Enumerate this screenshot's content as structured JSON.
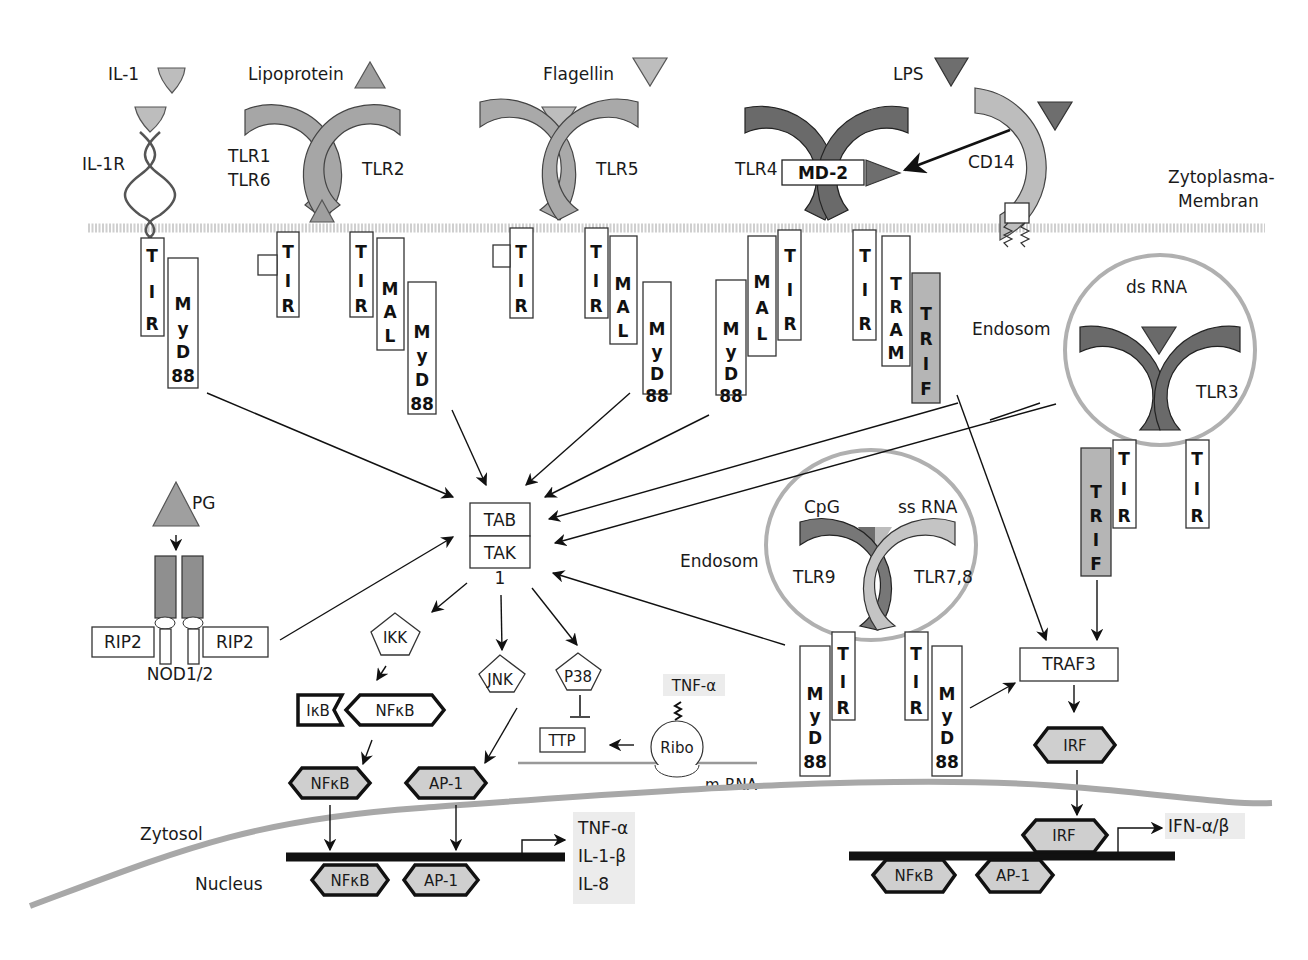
{
  "diagram": {
    "colors": {
      "ligand_light": "#bdbdbd",
      "ligand_dark": "#6e6e6e",
      "receptor_light": "#bfbfbf",
      "receptor_medium": "#9a9a9a",
      "receptor_dark": "#6a6a6a",
      "trif": "#b5b5b5",
      "transcription_factor": "#cfcfcf",
      "membrane": "#cfcfcf",
      "nuclear_membrane": "#a8a8a8"
    },
    "ligands": {
      "il1": "IL-1",
      "lipoprotein": "Lipoprotein",
      "flagellin": "Flagellin",
      "lps": "LPS",
      "ds_rna": "ds RNA",
      "cpg": "CpG",
      "ss_rna": "ss RNA",
      "pg": "PG"
    },
    "receptors": {
      "il1r": "IL-1R",
      "tlr1": "TLR1",
      "tlr6": "TLR6",
      "tlr2": "TLR2",
      "tlr5": "TLR5",
      "tlr4": "TLR4",
      "md2": "MD-2",
      "cd14": "CD14",
      "tlr3": "TLR3",
      "tlr9": "TLR9",
      "tlr78": "TLR7,8",
      "nod": "NOD1/2",
      "rip2_left": "RIP2",
      "rip2_right": "RIP2"
    },
    "adaptors": {
      "tir": [
        "T",
        "I",
        "R"
      ],
      "mal": [
        "M",
        "A",
        "L"
      ],
      "myd88": [
        "M",
        "y",
        "D",
        "88"
      ],
      "tram": [
        "T",
        "R",
        "A",
        "M"
      ],
      "trif": [
        "T",
        "R",
        "I",
        "F"
      ]
    },
    "compartments": {
      "plasma_membrane_line1": "Zytoplasma-",
      "plasma_membrane_line2": "Membran",
      "endosome_top": "Endosom",
      "endosome_mid": "Endosom",
      "cytosol": "Zytosol",
      "nucleus": "Nucleus"
    },
    "signaling": {
      "tab": "TAB",
      "tak": "TAK",
      "tak_sub": "1",
      "ikk": "IKK",
      "jnk": "JNK",
      "p38": "P38",
      "ikb": "IκB",
      "nfkb": "NFκB",
      "ap1": "AP-1",
      "ttp": "TTP",
      "ribo": "Ribo",
      "mrna": "m-RNA",
      "tnf_alpha_transcript": "TNF-α",
      "traf3": "TRAF3",
      "irf": "IRF"
    },
    "nucleus_factors": {
      "left": [
        "NFκB",
        "AP-1"
      ],
      "right": [
        "NFκB",
        "AP-1"
      ],
      "irf": "IRF"
    },
    "outputs": {
      "cytokines": [
        "TNF-α",
        "IL-1-β",
        "IL-8"
      ],
      "interferons": "IFN-α/β"
    }
  }
}
